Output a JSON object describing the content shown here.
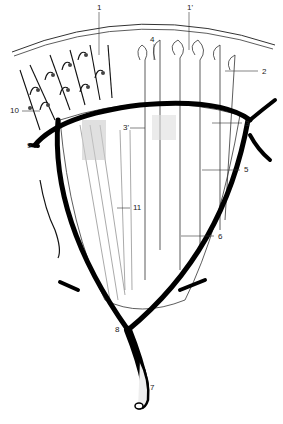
{
  "figure": {
    "labels": [
      {
        "id": "l1",
        "text": "1",
        "x": 97,
        "y": 4
      },
      {
        "id": "l1p",
        "text": "1'",
        "x": 187,
        "y": 4
      },
      {
        "id": "l2",
        "text": "2",
        "x": 262,
        "y": 68
      },
      {
        "id": "l3",
        "text": "3",
        "x": 245,
        "y": 121
      },
      {
        "id": "l3p",
        "text": "3'",
        "x": 125,
        "y": 125
      },
      {
        "id": "l4",
        "text": "4",
        "x": 150,
        "y": 36
      },
      {
        "id": "l5",
        "text": "5",
        "x": 244,
        "y": 167
      },
      {
        "id": "l6",
        "text": "6",
        "x": 218,
        "y": 234
      },
      {
        "id": "l7",
        "text": "7",
        "x": 150,
        "y": 385
      },
      {
        "id": "l8",
        "text": "8",
        "x": 115,
        "y": 326
      },
      {
        "id": "l9",
        "text": "9",
        "x": 27,
        "y": 142
      },
      {
        "id": "l10",
        "text": "10",
        "x": 12,
        "y": 108
      },
      {
        "id": "l11",
        "text": "11",
        "x": 134,
        "y": 205
      }
    ]
  }
}
